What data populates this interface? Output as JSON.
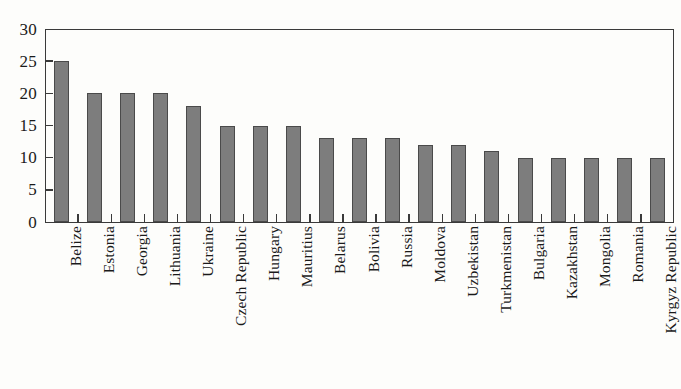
{
  "chart_data": {
    "type": "bar",
    "title": "",
    "subtitle": "",
    "xlabel": "",
    "ylabel": "",
    "ylim": [
      0,
      30
    ],
    "ytick_step": 5,
    "yticks": [
      0,
      5,
      10,
      15,
      20,
      25,
      30
    ],
    "ytick_labels": [
      "0",
      "5",
      "10",
      "15",
      "20",
      "25",
      "30"
    ],
    "grid": false,
    "legend": false,
    "legend_position": "none",
    "orientation": "vertical",
    "xtick_label_rotation": 90,
    "categories": [
      "Belize",
      "Estonia",
      "Georgia",
      "Lithuania",
      "Ukraine",
      "Czech Republic",
      "Hungary",
      "Mauritius",
      "Belarus",
      "Bolivia",
      "Russia",
      "Moldova",
      "Uzbekistan",
      "Turkmenistan",
      "Bulgaria",
      "Kazakhstan",
      "Mongolia",
      "Romania",
      "Kyrgyz Republic"
    ],
    "values": [
      25,
      20,
      20,
      20,
      18,
      15,
      15,
      15,
      13,
      13,
      13,
      12,
      12,
      11,
      10,
      10,
      10,
      10,
      10
    ],
    "bar_color": "#7d7d7d",
    "bar_edge_color": "#4a4a4a",
    "axis_color": "#3a3a3a",
    "background_color": "#fdfdfb",
    "text_color": "#1a1a1a"
  }
}
